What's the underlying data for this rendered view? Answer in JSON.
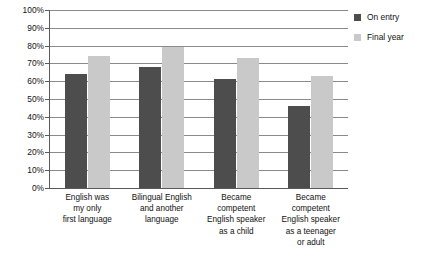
{
  "chart_data": {
    "type": "bar",
    "title": "",
    "subtitle": "",
    "xlabel": "",
    "ylabel": "",
    "ylim": [
      0,
      100
    ],
    "y_unit": "%",
    "grid": true,
    "legend_position": "right-top",
    "categories": [
      "English was\nmy only\nfirst language",
      "Bilingual English\nand another\nlanguage",
      "Became\ncompetent\nEnglish speaker\nas a child",
      "Became\ncompetent\nEnglish speaker\nas a teenager\nor adult"
    ],
    "category_lines": [
      [
        "English was",
        "my only",
        "first language"
      ],
      [
        "Bilingual English",
        "and another",
        "language"
      ],
      [
        "Became",
        "competent",
        "English speaker",
        "as a child"
      ],
      [
        "Became",
        "competent",
        "English speaker",
        "as a teenager",
        "or adult"
      ]
    ],
    "series": [
      {
        "name": "On entry",
        "color": "#4d4d4d",
        "values": [
          64,
          68,
          61,
          46
        ]
      },
      {
        "name": "Final year",
        "color": "#c9c9c9",
        "values": [
          74,
          79,
          73,
          63
        ]
      }
    ],
    "y_ticks": [
      0,
      10,
      20,
      30,
      40,
      50,
      60,
      70,
      80,
      90,
      100
    ],
    "y_tick_labels": [
      "0%",
      "10%",
      "20%",
      "30%",
      "40%",
      "50%",
      "60%",
      "70%",
      "80%",
      "90%",
      "100%"
    ],
    "annotations": []
  },
  "legend": {
    "items": [
      {
        "label": "On entry",
        "swatch": "legend-swatch-on-entry"
      },
      {
        "label": "Final year",
        "swatch": "legend-swatch-final-year"
      }
    ]
  },
  "colors": {
    "series_dark": "#4d4d4d",
    "series_light": "#c9c9c9",
    "gridline": "#8a8a8a",
    "axis": "#5a5a5a",
    "text": "#111111",
    "background": "#ffffff"
  }
}
